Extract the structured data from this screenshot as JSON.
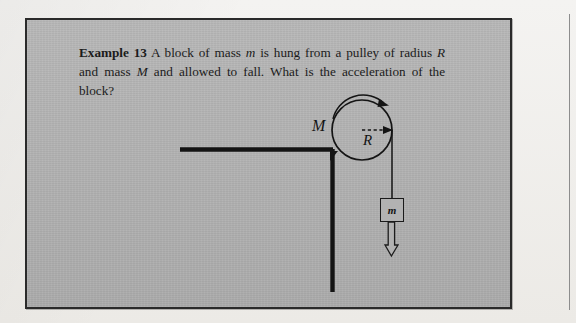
{
  "page": {
    "background_color": "#f2f1ef",
    "column_rule": true
  },
  "figure": {
    "frame_color": "#2a2a2a",
    "plate_color": "#b2b2b2"
  },
  "problem": {
    "label": "Example 13",
    "text_part_1": " A block of mass ",
    "var_m_1": "m",
    "text_part_2": " is hung from a pulley of radius ",
    "var_R": "R",
    "text_part_3": " and mass ",
    "var_M": "M",
    "text_part_4": " and allowed to fall. What is the acceleration of the block?"
  },
  "diagram": {
    "type": "physics-free-body-pulley",
    "labels": {
      "pulley_mass": "M",
      "pulley_radius": "R",
      "block_mass": "m"
    },
    "elements": {
      "support_beam": "horizontal-beam",
      "support_post": "vertical-post",
      "pulley": "circle",
      "rotation_arrow": "curved-arrow-clockwise",
      "radius_arrow": "dashed-arrow-right",
      "rope": "vertical-line",
      "block": "square",
      "acceleration_arrow": "hollow-down-arrow"
    },
    "geometry": {
      "pulley_center_x": 335,
      "pulley_center_y": 110,
      "pulley_radius_px": 30,
      "beam_y": 129,
      "beam_x_start": 153,
      "beam_x_end": 305,
      "post_x": 305,
      "post_y_end": 272,
      "rope_x": 365,
      "block_x": 353,
      "block_y": 178
    },
    "ink_color": "#141414"
  }
}
